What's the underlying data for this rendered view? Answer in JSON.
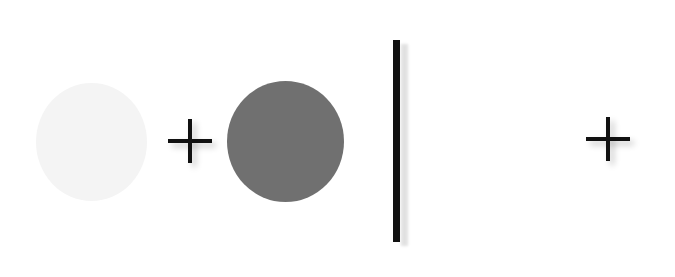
{
  "diagram": {
    "elements": [
      {
        "type": "circle",
        "shade": "light",
        "color": "#f4f4f4"
      },
      {
        "type": "operator",
        "symbol": "+"
      },
      {
        "type": "circle",
        "shade": "dark",
        "color": "#707070"
      },
      {
        "type": "divider",
        "orientation": "vertical",
        "color": "#111111"
      },
      {
        "type": "operator",
        "symbol": "+"
      }
    ],
    "colors": {
      "background": "#ffffff",
      "stroke": "#111111"
    }
  }
}
